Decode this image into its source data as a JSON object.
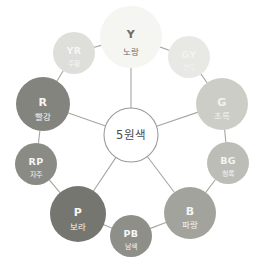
{
  "diagram": {
    "type": "color-wheel",
    "center": {
      "label": "5원색",
      "fill": "#ffffff",
      "stroke": "#9a9a96",
      "text_color": "#4a4a48",
      "cx": 131,
      "cy": 135,
      "r": 27,
      "font_size": 11.5
    },
    "link_color": "#a6a6a2",
    "link_width": 1.1,
    "background": "#ffffff",
    "nodes": [
      {
        "id": "Y",
        "code": "Y",
        "name": "노랑",
        "primary": true,
        "cx": 131,
        "cy": 37,
        "r": 31,
        "fill": "#f5f5f1",
        "text_color": "#6d6d6a",
        "code_size": 11,
        "name_size": 8.5,
        "spoke": true
      },
      {
        "id": "GY",
        "code": "GY",
        "name": "연두",
        "primary": false,
        "cx": 189,
        "cy": 57,
        "r": 21,
        "fill": "#e8e8e4",
        "text_color": "#f3f3f1",
        "code_size": 9.5,
        "name_size": 7,
        "spoke": false
      },
      {
        "id": "G",
        "code": "G",
        "name": "초록",
        "primary": true,
        "cx": 222,
        "cy": 104,
        "r": 26,
        "fill": "#cdcdc8",
        "text_color": "#f2f2f0",
        "code_size": 11,
        "name_size": 8.5,
        "spoke": true
      },
      {
        "id": "BG",
        "code": "BG",
        "name": "청록",
        "primary": false,
        "cx": 228,
        "cy": 163,
        "r": 21,
        "fill": "#bdbdb8",
        "text_color": "#f3f3f1",
        "code_size": 9.5,
        "name_size": 7,
        "spoke": false
      },
      {
        "id": "B",
        "code": "B",
        "name": "파랑",
        "primary": true,
        "cx": 190,
        "cy": 213,
        "r": 26,
        "fill": "#a3a39e",
        "text_color": "#f5f5f3",
        "code_size": 11,
        "name_size": 8.5,
        "spoke": true
      },
      {
        "id": "PB",
        "code": "PB",
        "name": "남색",
        "primary": false,
        "cx": 131,
        "cy": 236,
        "r": 21,
        "fill": "#8f8f8a",
        "text_color": "#f6f6f4",
        "code_size": 9.5,
        "name_size": 7,
        "spoke": false
      },
      {
        "id": "P",
        "code": "P",
        "name": "보라",
        "primary": true,
        "cx": 78,
        "cy": 214,
        "r": 28,
        "fill": "#767671",
        "text_color": "#f7f7f5",
        "code_size": 11,
        "name_size": 8.5,
        "spoke": true
      },
      {
        "id": "RP",
        "code": "RP",
        "name": "자주",
        "primary": false,
        "cx": 36,
        "cy": 164,
        "r": 21,
        "fill": "#8b8b86",
        "text_color": "#f6f6f4",
        "code_size": 9.5,
        "name_size": 7,
        "spoke": false
      },
      {
        "id": "R",
        "code": "R",
        "name": "빨강",
        "primary": true,
        "cx": 43,
        "cy": 104,
        "r": 27,
        "fill": "#84847f",
        "text_color": "#f6f6f4",
        "code_size": 11,
        "name_size": 8.5,
        "spoke": true
      },
      {
        "id": "YR",
        "code": "YR",
        "name": "주황",
        "primary": false,
        "cx": 74,
        "cy": 53,
        "r": 21,
        "fill": "#dededa",
        "text_color": "#f6f6f4",
        "code_size": 9.5,
        "name_size": 7,
        "spoke": false
      }
    ]
  }
}
